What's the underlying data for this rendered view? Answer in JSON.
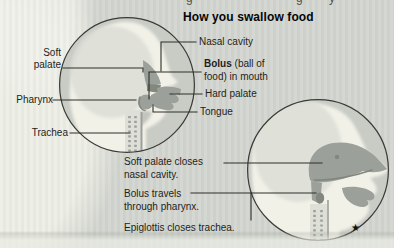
{
  "title": "How you swallow food",
  "figure1": {
    "labels": {
      "soft_palate": "Soft palate",
      "pharynx": "Pharynx",
      "trachea": "Trachea",
      "nasal_cavity": "Nasal cavity",
      "bolus_term": "Bolus",
      "bolus_line1_rest": " (ball of",
      "bolus_line2": "food) in mouth",
      "hard_palate": "Hard palate",
      "tongue": "Tongue"
    }
  },
  "figure2": {
    "captions": {
      "c1_line1": "Soft palate closes",
      "c1_line2": "nasal cavity.",
      "c2_line1": "Bolus travels",
      "c2_line2": "through pharynx.",
      "c3": "Epiglottis closes trachea."
    },
    "footnote_star": "★"
  },
  "decor": {
    "cropped_glyphs": [
      "g",
      "g",
      "y"
    ]
  },
  "palette": {
    "bg": "#d3d6d0",
    "blob": "#edeee5",
    "circle-fill": "#c8ccc5",
    "circle-stroke": "#3a3a36",
    "head": "#f2f1e8",
    "head-shade": "#dcded6",
    "anatomy-mid": "#9ba19a",
    "anatomy-dark": "#82887e",
    "trachea-bg": "#dedfd7",
    "line": "#2e2e2a",
    "text": "#1e1e1c",
    "title-color": "#060606"
  }
}
